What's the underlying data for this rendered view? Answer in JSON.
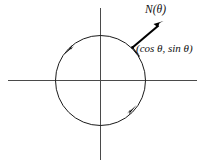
{
  "figure": {
    "background_color": "#ffffff",
    "width": 203,
    "height": 166
  },
  "labels": {
    "normal_vector": "N(θ)",
    "point_coordinates": "(cos θ, sin θ)"
  },
  "colors": {
    "axis": "#4a4a4a",
    "circle": "#1a1a1a",
    "vector": "#000000",
    "text": "#101010"
  },
  "geometry": {
    "center_x": 100.5,
    "center_y": 80.5,
    "radius": 45,
    "axis_horizontal_y": 80.5,
    "axis_horizontal_x1": 8,
    "axis_horizontal_x2": 197,
    "axis_vertical_x": 100.5,
    "axis_vertical_y1": 8,
    "axis_vertical_y2": 160,
    "vector_tail_x": 132.5,
    "vector_tail_y": 47.5,
    "vector_tip_x": 163,
    "vector_tip_y": 21.5,
    "orientation_arrow_upper_left": "counterclockwise",
    "orientation_arrow_lower_right": "counterclockwise"
  }
}
